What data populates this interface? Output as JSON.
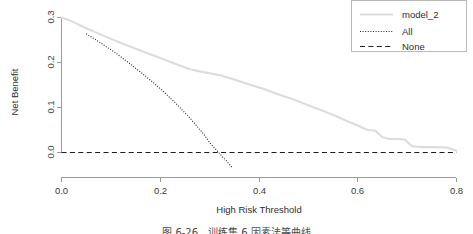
{
  "chart_data": {
    "type": "line",
    "title": "",
    "xlabel": "High Risk Threshold",
    "ylabel": "Net Benefit",
    "xlim": [
      0.0,
      0.82
    ],
    "ylim": [
      -0.02,
      0.315
    ],
    "xticks": [
      "0.0",
      "0.2",
      "0.4",
      "0.6",
      "0.8"
    ],
    "xtick_values": [
      0.0,
      0.2,
      0.4,
      0.6,
      0.8
    ],
    "yticks": [
      "0.0",
      "0.1",
      "0.2",
      "0.3"
    ],
    "ytick_values": [
      0.0,
      0.1,
      0.2,
      0.3
    ],
    "grid": false,
    "legend_position": "top-right",
    "series": [
      {
        "name": "model_2",
        "style": "solid",
        "color": "#dcdcdc",
        "x": [
          0.0,
          0.02,
          0.05,
          0.08,
          0.11,
          0.14,
          0.17,
          0.2,
          0.23,
          0.26,
          0.29,
          0.32,
          0.35,
          0.37,
          0.39,
          0.41,
          0.43,
          0.45,
          0.47,
          0.5,
          0.53,
          0.56,
          0.58,
          0.6,
          0.62,
          0.635,
          0.65,
          0.665,
          0.68,
          0.695,
          0.71,
          0.73,
          0.75,
          0.78,
          0.8
        ],
        "values": [
          0.3,
          0.292,
          0.276,
          0.262,
          0.248,
          0.235,
          0.222,
          0.21,
          0.197,
          0.185,
          0.178,
          0.172,
          0.162,
          0.155,
          0.148,
          0.141,
          0.133,
          0.125,
          0.118,
          0.105,
          0.092,
          0.079,
          0.069,
          0.06,
          0.05,
          0.049,
          0.034,
          0.03,
          0.03,
          0.029,
          0.014,
          0.012,
          0.012,
          0.011,
          0.004
        ]
      },
      {
        "name": "All",
        "style": "dotted",
        "color": "#262626",
        "x": [
          0.05,
          0.08,
          0.11,
          0.14,
          0.17,
          0.2,
          0.23,
          0.26,
          0.29,
          0.3,
          0.32,
          0.34,
          0.345
        ],
        "values": [
          0.264,
          0.243,
          0.221,
          0.196,
          0.17,
          0.142,
          0.111,
          0.077,
          0.038,
          0.022,
          -0.002,
          -0.026,
          -0.033
        ]
      },
      {
        "name": "None",
        "style": "dashed",
        "color": "#1c1c1c",
        "x": [
          0.0,
          0.8
        ],
        "values": [
          0.0,
          0.0
        ]
      }
    ]
  },
  "legend": {
    "entries": [
      {
        "label": "model_2"
      },
      {
        "label": "All"
      },
      {
        "label": "None"
      }
    ]
  },
  "caption": {
    "text": "图 6-26　训练集 6 因素法等曲线"
  }
}
